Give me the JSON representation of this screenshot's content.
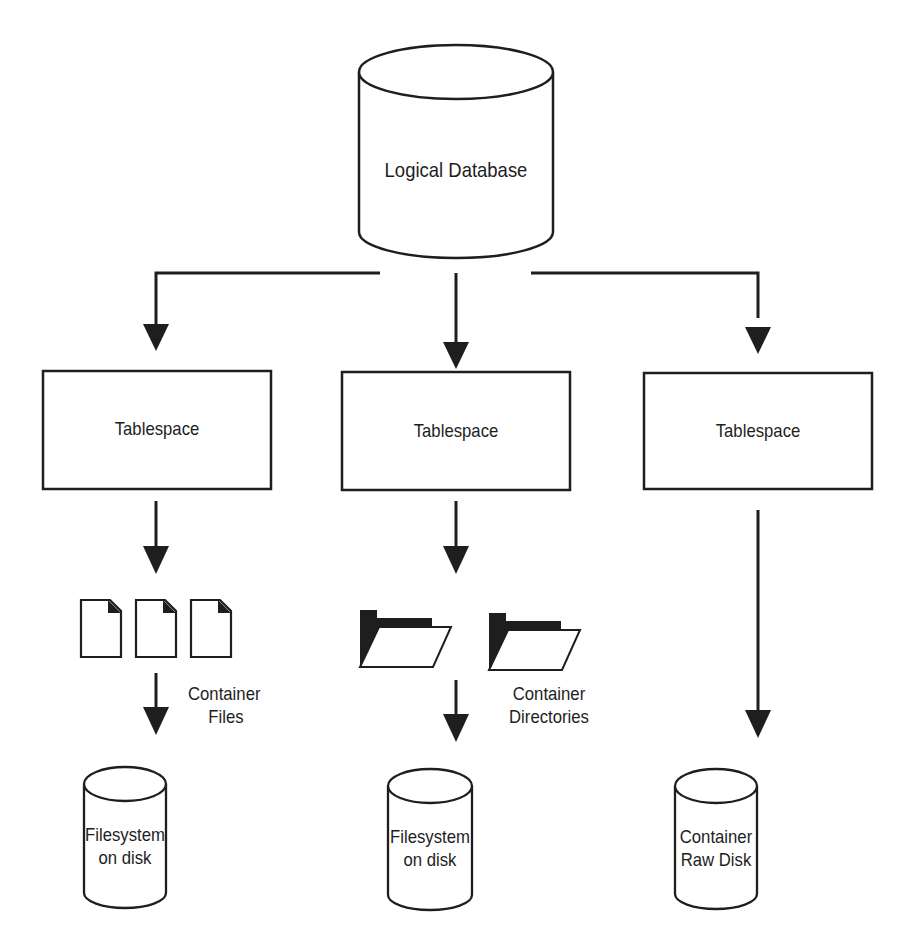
{
  "diagram": {
    "colors": {
      "stroke": "#1e1e1e",
      "fill": "#ffffff",
      "background": "#ffffff"
    },
    "root": {
      "label": "Logical Database",
      "shape": "cylinder"
    },
    "tablespaces": [
      {
        "label": "Tablespace"
      },
      {
        "label": "Tablespace"
      },
      {
        "label": "Tablespace"
      }
    ],
    "containers": [
      {
        "type": "files",
        "icon": "document-icon",
        "count": 3,
        "label_lines": [
          "Container",
          "Files"
        ]
      },
      {
        "type": "directories",
        "icon": "folder-icon",
        "count": 2,
        "label_lines": [
          "Container",
          "Directories"
        ]
      },
      {
        "type": "raw-disk",
        "label_lines": []
      }
    ],
    "storage": [
      {
        "label_lines": [
          "Filesystem",
          "on disk"
        ],
        "shape": "cylinder"
      },
      {
        "label_lines": [
          "Filesystem",
          "on disk"
        ],
        "shape": "cylinder"
      },
      {
        "label_lines": [
          "Container",
          "Raw Disk"
        ],
        "shape": "cylinder"
      }
    ],
    "edges": [
      {
        "from": "Logical Database",
        "to": "Tablespace 1"
      },
      {
        "from": "Logical Database",
        "to": "Tablespace 2"
      },
      {
        "from": "Logical Database",
        "to": "Tablespace 3"
      },
      {
        "from": "Tablespace 1",
        "to": "Container Files"
      },
      {
        "from": "Container Files",
        "to": "Filesystem on disk (1)"
      },
      {
        "from": "Tablespace 2",
        "to": "Container Directories"
      },
      {
        "from": "Container Directories",
        "to": "Filesystem on disk (2)"
      },
      {
        "from": "Tablespace 3",
        "to": "Container Raw Disk"
      }
    ]
  }
}
